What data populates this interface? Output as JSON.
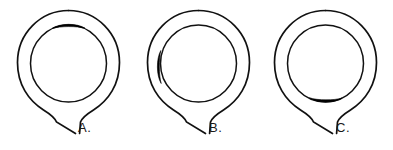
{
  "diagram": {
    "background_color": "#ffffff",
    "stroke_color": "#111111",
    "fill_color": "#000000",
    "figures": [
      {
        "id": "A",
        "label": "A.",
        "lesion_position": "top",
        "lesion_clock": "12 o'clock",
        "lesion_shape": "lens",
        "outer_ring": "open circle with inferior stem",
        "inner_ring": "open circle"
      },
      {
        "id": "B",
        "label": "B.",
        "lesion_position": "left",
        "lesion_clock": "9 o'clock",
        "lesion_shape": "lens",
        "outer_ring": "open circle with inferior stem",
        "inner_ring": "open circle"
      },
      {
        "id": "C",
        "label": "C.",
        "lesion_position": "bottom",
        "lesion_clock": "6 o'clock",
        "lesion_shape": "lens",
        "outer_ring": "open circle with inferior stem",
        "inner_ring": "open circle"
      }
    ]
  }
}
